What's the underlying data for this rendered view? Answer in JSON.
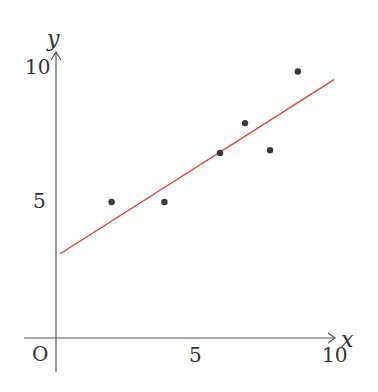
{
  "chart_data": {
    "type": "scatter",
    "title": "",
    "xlabel": "x",
    "ylabel": "y",
    "origin_label": "O",
    "x_ticks": [
      5,
      10
    ],
    "y_ticks": [
      5,
      10
    ],
    "x_tick_labels": [
      "5",
      "10"
    ],
    "y_tick_labels": [
      "5",
      "10"
    ],
    "xlim": [
      0,
      10
    ],
    "ylim": [
      0,
      10
    ],
    "grid": false,
    "legend": null,
    "points": [
      {
        "x": 2.0,
        "y": 5.0
      },
      {
        "x": 3.9,
        "y": 5.0
      },
      {
        "x": 5.9,
        "y": 6.8
      },
      {
        "x": 6.8,
        "y": 7.9
      },
      {
        "x": 7.7,
        "y": 6.9
      },
      {
        "x": 8.7,
        "y": 9.8
      }
    ],
    "regression_line": {
      "intercept": 3.0,
      "slope": 0.65,
      "x_start": 0.15,
      "x_end": 10.0,
      "color": "#e8403a"
    },
    "point_color": "#3a3a3a",
    "axis_color": "#555555"
  }
}
